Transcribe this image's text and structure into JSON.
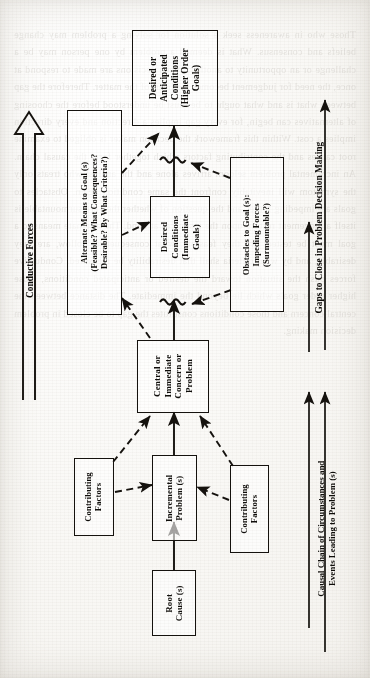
{
  "page": {
    "figure_kind": "flow-diagram",
    "orientation": "rotated-90-ccw",
    "ghost_text": "Those who in awareness seek a solution for solving a problem may change beliefs and consensus. What is deemed a problem by one person may be a challenge or an opportunity to another. When decisions are made to respond at once, the need for judgement becomes the heart of the matter. Therefore the gap between what is and what ought to be must be understood before the choosing of alternatives can begin, for every gap implies a direction and every direction implies a cost. Within this framework the decision maker is obliged to examine root causes and the contributing factors which together form the causal chain. An incremental problem seldom arrives alone and the analyst who treats only the symptom will inevitably confront the same condition again. Obstacles to goals are impeding forces and the question of whether they are surmountable is itself a judgement resting upon the resources at hand. The alternate means to a goal must be tested: are they feasible, what consequences follow, are they desirable, and by what criteria shall that desirability be measured. Conductive forces push the situation toward the desired or anticipated conditions, those higher order goals which lie beyond the immediate. The distance between the central concern and those conditions constitutes the gap to be closed in problem decision making."
  },
  "diagram": {
    "nodes": [
      {
        "id": "higher-order-goals",
        "lines": [
          "Desired or",
          "Anticipated",
          "Conditions",
          "(Higher Order",
          "Goals)"
        ]
      },
      {
        "id": "alternate-means",
        "lines": [
          "Alternate Means to Goal (s)",
          "(Feasible? What Consequences?",
          "Desirable? By What Criteria?)"
        ]
      },
      {
        "id": "immediate-goals",
        "lines": [
          "Desired",
          "Conditions",
          "(Immediate",
          "Goals)"
        ]
      },
      {
        "id": "obstacles",
        "lines": [
          "Obstacles to Goal (s):",
          "Impeding Forces",
          "(Surmountable?)"
        ]
      },
      {
        "id": "central-problem",
        "lines": [
          "Central or",
          "Immediate",
          "Concern or",
          "Problem"
        ]
      },
      {
        "id": "contributing-left",
        "lines": [
          "Contributing",
          "Factors"
        ]
      },
      {
        "id": "incremental",
        "lines": [
          "Incremental",
          "Problem (s)"
        ]
      },
      {
        "id": "contributing-right",
        "lines": [
          "Contributing",
          "Factors"
        ]
      },
      {
        "id": "root-cause",
        "lines": [
          "Root",
          "Cause (s)"
        ]
      }
    ],
    "axes": [
      {
        "id": "conductive-forces",
        "lines": [
          "Conductive Forces"
        ]
      },
      {
        "id": "gaps-to-close",
        "lines": [
          "Gaps to Close in Problem Decision Making"
        ]
      },
      {
        "id": "causal-chain",
        "lines": [
          "Causal Chain of Circumstances and",
          "Events Leading to Problem (s)"
        ]
      }
    ],
    "ink_color": "#15120e",
    "paper_color": "#fbfaf8"
  }
}
